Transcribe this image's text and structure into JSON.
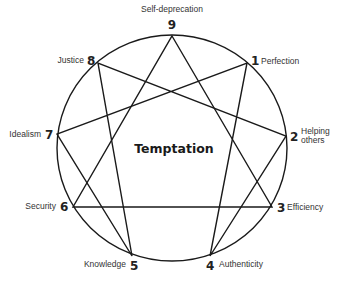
{
  "diagram": {
    "title": "Temptation",
    "line_color": "#1a1a1a",
    "circle": {
      "cx": 172,
      "cy": 148,
      "rx": 115,
      "ry": 113
    },
    "points": [
      {
        "num": "1",
        "label": "Perfection",
        "x": 247,
        "y": 63
      },
      {
        "num": "2",
        "label": "Helping",
        "label2": "others",
        "x": 286,
        "y": 136
      },
      {
        "num": "3",
        "label": "Efficiency",
        "x": 272,
        "y": 207
      },
      {
        "num": "4",
        "label": "Authenticity",
        "x": 210,
        "y": 256
      },
      {
        "num": "5",
        "label": "Knowledge",
        "x": 132,
        "y": 256
      },
      {
        "num": "6",
        "label": "Security",
        "x": 73,
        "y": 207
      },
      {
        "num": "7",
        "label": "Idealism",
        "x": 57,
        "y": 134
      },
      {
        "num": "8",
        "label": "Justice",
        "x": 98,
        "y": 63
      },
      {
        "num": "9",
        "label": "Self-deprecation",
        "x": 172,
        "y": 36
      }
    ],
    "triangle": [
      "9",
      "3",
      "6"
    ],
    "hexad": [
      "1",
      "4",
      "2",
      "8",
      "5",
      "7"
    ]
  }
}
